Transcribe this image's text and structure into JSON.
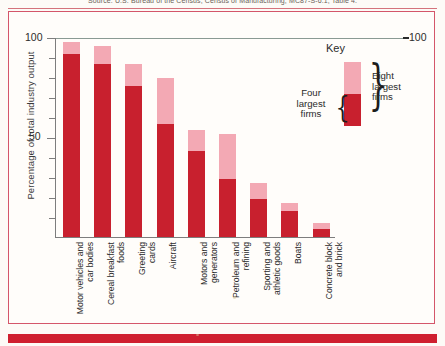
{
  "page": {
    "top_caption": "Source: U.S. Bureau of the Census, Census of Manufacturing, MC87-S-6.1, Table 4."
  },
  "chart_data": {
    "type": "bar",
    "title": "",
    "subtitle": "",
    "xlabel": "",
    "ylabel": "Percentage of total industry output",
    "ylim": [
      0,
      100
    ],
    "ytick_labels": [
      "50",
      "100"
    ],
    "ytick_values": [
      50,
      100
    ],
    "right_axis_label": "100",
    "grid": false,
    "stacked": true,
    "legend_position": "inside-top-right",
    "categories": [
      "Motor vehicles and\ncar bodies",
      "Cereal breakfast\nfoods",
      "Greeting\ncards",
      "Aircraft",
      "Motors and\ngenerators",
      "Petroleum and\nrefining",
      "Sporting and\nathletic goods",
      "Boats",
      "Concrete block\nand brick"
    ],
    "series": [
      {
        "name": "Four largest firms",
        "color": "#c8202e",
        "values": [
          92,
          87,
          76,
          57,
          43,
          29,
          19,
          13,
          4
        ]
      },
      {
        "name": "Eight largest firms",
        "color": "#f3a9b4",
        "values": [
          98,
          96,
          87,
          80,
          54,
          52,
          27,
          17,
          7
        ]
      }
    ]
  },
  "legend": {
    "title": "Key",
    "four_label": "Four\nlargest\nfirms",
    "eight_label": "Eight\nlargest\nfirms",
    "brace_left": "{",
    "brace_right": "}"
  },
  "colors": {
    "dark_red": "#c8202e",
    "light_pink": "#f3a9b4",
    "frame": "#d4566a",
    "axis": "#7d7d7d",
    "bottom_bar": "#cf2030"
  }
}
